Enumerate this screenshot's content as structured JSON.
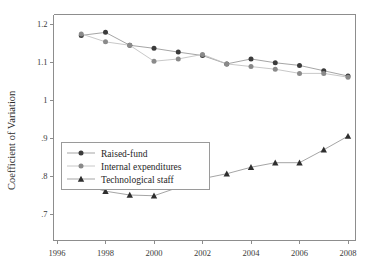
{
  "chart_data": {
    "type": "line",
    "title": "",
    "xlabel": "",
    "ylabel": "Coefficient of Variation",
    "xlim": [
      1996,
      2008.6
    ],
    "ylim": [
      0.7,
      1.23
    ],
    "grid": false,
    "legend_position": "center-left",
    "x_ticks": [
      "1996",
      "1998",
      "2000",
      "2002",
      "2004",
      "2006",
      "2008"
    ],
    "x_tick_values": [
      1996,
      1998,
      2000,
      2002,
      2004,
      2006,
      2008
    ],
    "y_ticks": [
      "1.2",
      "1.1",
      "1",
      ".9",
      ".8",
      ".7"
    ],
    "y_tick_values": [
      1.2,
      1.1,
      1.0,
      0.9,
      0.8,
      0.7
    ],
    "x": [
      1997,
      1998,
      1999,
      2000,
      2001,
      2002,
      2003,
      2004,
      2005,
      2006,
      2007,
      2008
    ],
    "series": [
      {
        "name": "Raised-fund",
        "marker": "circle-dark",
        "color": "#3b3b3b",
        "line_color": "#9b9b9b",
        "values": [
          1.17,
          1.178,
          1.144,
          1.136,
          1.126,
          1.117,
          1.095,
          1.108,
          1.098,
          1.091,
          1.077,
          1.063
        ]
      },
      {
        "name": "Internal expenditures",
        "marker": "circle-light",
        "color": "#8a8a8a",
        "line_color": "#c2c2c2",
        "values": [
          1.174,
          1.153,
          1.144,
          1.102,
          1.108,
          1.12,
          1.095,
          1.088,
          1.081,
          1.07,
          1.07,
          1.06
        ]
      },
      {
        "name": "Technological staff",
        "marker": "triangle",
        "color": "#2e2e2e",
        "line_color": "#9b9b9b",
        "values": [
          0.778,
          0.76,
          0.75,
          0.748,
          0.77,
          0.793,
          0.806,
          0.823,
          0.835,
          0.835,
          0.869,
          0.905
        ]
      }
    ]
  }
}
